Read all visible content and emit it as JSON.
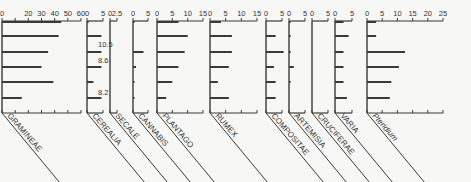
{
  "chart_data": {
    "type": "bar",
    "title": "",
    "orientation": "horizontal",
    "depth_labels": [
      "10.5",
      "8.6",
      "8.2"
    ],
    "rows": 6,
    "panels": [
      {
        "name": "GRAMINEAE",
        "italic": false,
        "ticks": [
          0,
          10,
          20,
          30,
          40,
          50,
          60
        ],
        "tick_labels": [
          "0",
          "20",
          "30",
          "40",
          "50",
          "60"
        ],
        "max": 60,
        "values": [
          45,
          43,
          35,
          30,
          39,
          15
        ]
      },
      {
        "name": "CEREALIA",
        "italic": false,
        "ticks": [
          0,
          5
        ],
        "tick_labels": [
          "0",
          "5"
        ],
        "max": 5,
        "values": [
          0.5,
          4.5,
          4.5,
          4.5,
          2,
          4.5
        ]
      },
      {
        "name": "SECALE",
        "italic": false,
        "ticks": [
          0,
          2.5
        ],
        "tick_labels": [
          "0",
          "2.5"
        ],
        "max": 2.5,
        "values": [
          0,
          0,
          0,
          0,
          0,
          0
        ]
      },
      {
        "name": "CANNABIS",
        "italic": false,
        "ticks": [
          0,
          5
        ],
        "tick_labels": [
          "0",
          "5"
        ],
        "max": 5,
        "values": [
          0.2,
          0,
          3.5,
          1,
          0.5,
          0.5
        ]
      },
      {
        "name": "PLANTAGO",
        "italic": false,
        "ticks": [
          0,
          5,
          10,
          15
        ],
        "tick_labels": [
          "0",
          "5",
          "10",
          "15"
        ],
        "max": 15,
        "values": [
          7,
          10,
          9,
          7,
          5,
          3
        ]
      },
      {
        "name": "RUMEX",
        "italic": false,
        "ticks": [
          0,
          5,
          10,
          15
        ],
        "tick_labels": [
          "0",
          "5",
          "10",
          "15"
        ],
        "max": 15,
        "values": [
          3.5,
          7,
          7,
          6,
          2.5,
          6
        ]
      },
      {
        "name": "COMPOSITAE",
        "italic": false,
        "ticks": [
          0,
          5
        ],
        "tick_labels": [
          "0",
          "5"
        ],
        "max": 5,
        "values": [
          0,
          3,
          5.5,
          2.5,
          3,
          3
        ]
      },
      {
        "name": "ARTEMISIA",
        "italic": false,
        "ticks": [
          0,
          5
        ],
        "tick_labels": [
          "0",
          "5"
        ],
        "max": 5,
        "values": [
          0.3,
          0.5,
          0.5,
          1.5,
          0.5,
          0
        ]
      },
      {
        "name": "CRUCIFERAE",
        "italic": false,
        "ticks": [
          0,
          5
        ],
        "tick_labels": [
          "0",
          "5"
        ],
        "max": 5,
        "values": [
          0,
          0,
          0,
          0,
          0,
          0
        ]
      },
      {
        "name": "VARIA",
        "italic": false,
        "ticks": [
          0,
          5
        ],
        "tick_labels": [
          "0",
          "5"
        ],
        "max": 5,
        "values": [
          2.5,
          4,
          2.5,
          2.5,
          2.5,
          3.5
        ]
      },
      {
        "name": "Pteridium",
        "italic": true,
        "ticks": [
          0,
          5,
          10,
          15,
          20,
          25
        ],
        "tick_labels": [
          "0",
          "5",
          "10",
          "15",
          "20",
          "25"
        ],
        "max": 25,
        "values": [
          3,
          3,
          12.5,
          10.5,
          8,
          7.5
        ]
      }
    ],
    "xlabel": "%",
    "ylabel": "",
    "grid": false,
    "legend": "none"
  },
  "layout": {
    "top_axis_y": 21,
    "bottom_axis_y": 113,
    "row_y": [
      22,
      36,
      52,
      67,
      82,
      98
    ],
    "panel_x": [
      {
        "x0": 2,
        "x1": 81
      },
      {
        "x0": 87,
        "x1": 103
      },
      {
        "x0": 110,
        "x1": 117
      },
      {
        "x0": 133,
        "x1": 148
      },
      {
        "x0": 157,
        "x1": 203
      },
      {
        "x0": 210,
        "x1": 257
      },
      {
        "x0": 266,
        "x1": 282
      },
      {
        "x0": 289,
        "x1": 305
      },
      {
        "x0": 312,
        "x1": 328
      },
      {
        "x0": 335,
        "x1": 352
      },
      {
        "x0": 367,
        "x1": 443
      }
    ],
    "depth_label_pos": [
      {
        "x": 98,
        "y": 47
      },
      {
        "x": 98,
        "y": 63
      },
      {
        "x": 98,
        "y": 95
      }
    ],
    "ink": "#3a3a3a"
  }
}
